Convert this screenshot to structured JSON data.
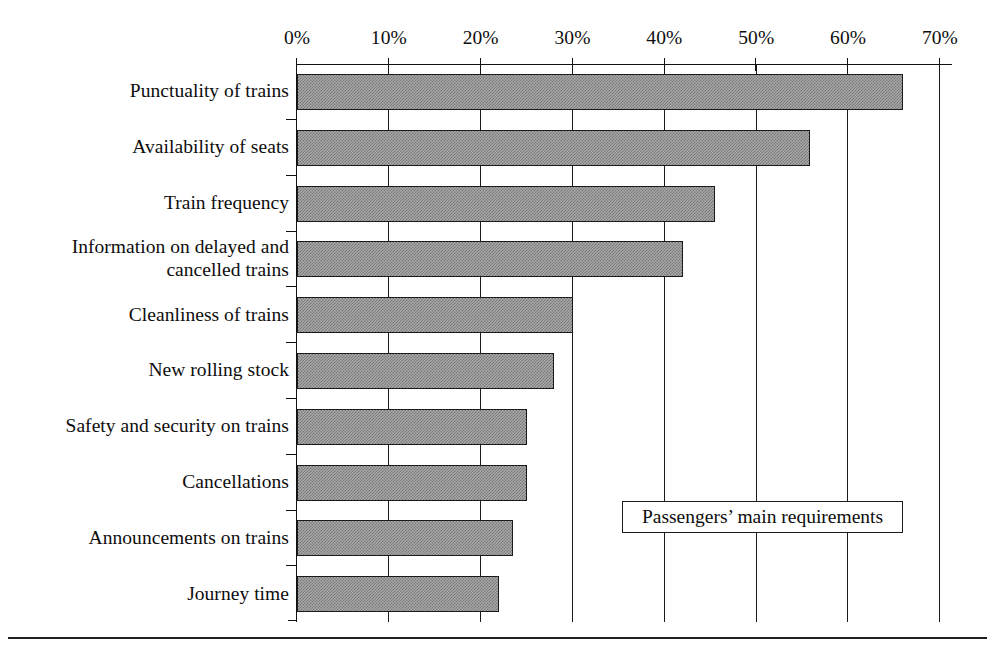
{
  "chart_data": {
    "type": "bar",
    "orientation": "horizontal",
    "title": "",
    "xlabel": "",
    "ylabel": "",
    "xlim": [
      0,
      70
    ],
    "xticks": [
      0,
      10,
      20,
      30,
      40,
      50,
      60,
      70
    ],
    "xtick_labels": [
      "0%",
      "10%",
      "20%",
      "30%",
      "40%",
      "50%",
      "60%",
      "70%"
    ],
    "grid": "vertical",
    "legend": {
      "text": "Passengers’ main requirements",
      "position": "center-right-inside"
    },
    "bar_color": "#a9a9a9",
    "bar_edge_color": "#1a1a1a",
    "categories": [
      "Punctuality of trains",
      "Availability of seats",
      "Train frequency",
      "Information on delayed and\ncancelled trains",
      "Cleanliness of trains",
      "New rolling stock",
      "Safety and security on trains",
      "Cancellations",
      "Announcements on trains",
      "Journey time"
    ],
    "values": [
      66,
      55.8,
      45.5,
      42,
      30,
      28,
      25,
      25,
      23.5,
      22
    ],
    "value_unit": "%"
  }
}
